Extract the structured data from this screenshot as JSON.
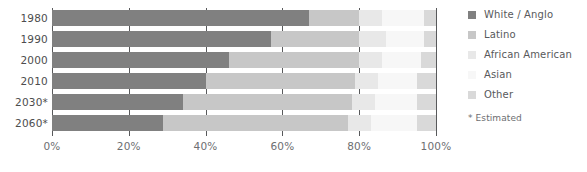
{
  "chart_data": {
    "type": "bar",
    "subtype": "horizontal-stacked-100",
    "title": "",
    "xlabel": "",
    "ylabel": "",
    "xlim": [
      0,
      100
    ],
    "xticks": [
      0,
      20,
      40,
      60,
      80,
      100
    ],
    "xtick_labels": [
      "0%",
      "20%",
      "40%",
      "60%",
      "80%",
      "100%"
    ],
    "grid": true,
    "grid_axis": "x",
    "legend_position": "right",
    "categories": [
      "1980",
      "1990",
      "2000",
      "2010",
      "2030*",
      "2060*"
    ],
    "series": [
      {
        "name": "White / Anglo",
        "color": "#808080",
        "values": [
          67,
          57,
          46,
          40,
          34,
          29
        ]
      },
      {
        "name": "Latino",
        "color": "#c7c7c7",
        "values": [
          13,
          23,
          34,
          39,
          44,
          48
        ]
      },
      {
        "name": "African American",
        "color": "#e8e8e8",
        "values": [
          6,
          7,
          6,
          6,
          6,
          6
        ]
      },
      {
        "name": "Asian",
        "color": "#f7f7f7",
        "values": [
          11,
          10,
          10,
          10,
          11,
          12
        ]
      },
      {
        "name": "Other",
        "color": "#d9d9d9",
        "values": [
          3,
          3,
          4,
          5,
          5,
          5
        ]
      }
    ],
    "annotations": [
      "* Estimated"
    ]
  },
  "axis": {
    "ticks": [
      {
        "label": "0%",
        "value": 0
      },
      {
        "label": "20%",
        "value": 20
      },
      {
        "label": "40%",
        "value": 40
      },
      {
        "label": "60%",
        "value": 60
      },
      {
        "label": "80%",
        "value": 80
      },
      {
        "label": "100%",
        "value": 100
      }
    ]
  },
  "rows": [
    {
      "label": "1980"
    },
    {
      "label": "1990"
    },
    {
      "label": "2000"
    },
    {
      "label": "2010"
    },
    {
      "label": "2030*"
    },
    {
      "label": "2060*"
    }
  ],
  "legend": {
    "items": [
      {
        "label": "White / Anglo",
        "color": "#808080"
      },
      {
        "label": "Latino",
        "color": "#c7c7c7"
      },
      {
        "label": "African American",
        "color": "#e8e8e8"
      },
      {
        "label": "Asian",
        "color": "#f7f7f7"
      },
      {
        "label": "Other",
        "color": "#d9d9d9"
      }
    ],
    "footnote": "* Estimated"
  }
}
